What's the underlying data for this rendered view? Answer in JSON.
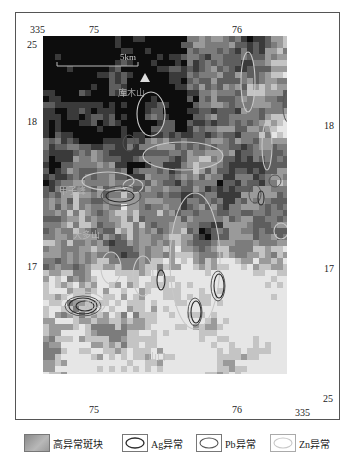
{
  "map": {
    "axis_labels": {
      "top": [
        {
          "text": "335",
          "x": 30,
          "y": 25
        },
        {
          "text": "75",
          "x": 89,
          "y": 25
        },
        {
          "text": "76",
          "x": 232,
          "y": 25
        }
      ],
      "bottom": [
        {
          "text": "75",
          "x": 89,
          "y": 405
        },
        {
          "text": "76",
          "x": 232,
          "y": 405
        },
        {
          "text": "335",
          "x": 295,
          "y": 408
        }
      ],
      "left": [
        {
          "text": "25",
          "x": 27,
          "y": 40
        },
        {
          "text": "18",
          "x": 27,
          "y": 117
        },
        {
          "text": "17",
          "x": 27,
          "y": 262
        }
      ],
      "right": [
        {
          "text": "18",
          "x": 324,
          "y": 121
        },
        {
          "text": "17",
          "x": 324,
          "y": 264
        },
        {
          "text": "25",
          "x": 323,
          "y": 394
        }
      ]
    },
    "scale_bar": {
      "label": "5km",
      "x1": 14,
      "x2": 95,
      "y": 30
    },
    "triangle_marker": {
      "x": 102,
      "y": 42
    },
    "place_names": [
      {
        "text": "库木山",
        "x": 75,
        "y": 50
      },
      {
        "text": "甲子峰",
        "x": 16,
        "y": 148
      },
      {
        "text": "大多山",
        "x": 30,
        "y": 192
      },
      {
        "text": "双山",
        "x": 42,
        "y": 262
      },
      {
        "text": "山口",
        "x": 105,
        "y": 314
      }
    ],
    "colors": {
      "pixel_levels": [
        "#0d0d0d",
        "#3a3a3a",
        "#5e5e5e",
        "#7c7c7c",
        "#9a9a9a",
        "#c4c4c4",
        "#e6e6e6"
      ],
      "ag": "#2a2a2a",
      "pb": "#555555",
      "zn": "#c8c8c8"
    },
    "anomalies": {
      "ag": [
        {
          "cx": 40,
          "cy": 270,
          "rx": 14,
          "ry": 8
        },
        {
          "cx": 42,
          "cy": 270,
          "rx": 9,
          "ry": 5
        },
        {
          "cx": 77,
          "cy": 160,
          "rx": 14,
          "ry": 6
        },
        {
          "cx": 153,
          "cy": 276,
          "rx": 5,
          "ry": 11
        },
        {
          "cx": 176,
          "cy": 250,
          "rx": 5,
          "ry": 12
        },
        {
          "cx": 218,
          "cy": 162,
          "rx": 3,
          "ry": 7
        },
        {
          "cx": 118,
          "cy": 244,
          "rx": 4,
          "ry": 10
        }
      ],
      "pb": [
        {
          "cx": 40,
          "cy": 270,
          "rx": 18,
          "ry": 10
        },
        {
          "cx": 78,
          "cy": 160,
          "rx": 20,
          "ry": 10
        },
        {
          "cx": 152,
          "cy": 276,
          "rx": 7,
          "ry": 14
        },
        {
          "cx": 175,
          "cy": 250,
          "rx": 7,
          "ry": 15
        },
        {
          "cx": 212,
          "cy": 158,
          "rx": 6,
          "ry": 9
        },
        {
          "cx": 232,
          "cy": 145,
          "rx": 6,
          "ry": 6
        },
        {
          "cx": 86,
          "cy": 107,
          "rx": 6,
          "ry": 8
        },
        {
          "cx": 245,
          "cy": 70,
          "rx": 5,
          "ry": 16
        }
      ],
      "zn": [
        {
          "cx": 40,
          "cy": 268,
          "rx": 22,
          "ry": 12
        },
        {
          "cx": 65,
          "cy": 145,
          "rx": 26,
          "ry": 9
        },
        {
          "cx": 90,
          "cy": 150,
          "rx": 10,
          "ry": 7
        },
        {
          "cx": 152,
          "cy": 225,
          "rx": 25,
          "ry": 68
        },
        {
          "cx": 140,
          "cy": 120,
          "rx": 40,
          "ry": 14
        },
        {
          "cx": 108,
          "cy": 78,
          "rx": 14,
          "ry": 22
        },
        {
          "cx": 205,
          "cy": 46,
          "rx": 7,
          "ry": 30
        },
        {
          "cx": 224,
          "cy": 110,
          "rx": 5,
          "ry": 24
        },
        {
          "cx": 238,
          "cy": 195,
          "rx": 7,
          "ry": 8
        },
        {
          "cx": 68,
          "cy": 232,
          "rx": 10,
          "ry": 16
        },
        {
          "cx": 100,
          "cy": 240,
          "rx": 10,
          "ry": 20
        }
      ]
    }
  },
  "legend": {
    "items": [
      {
        "label": "高异常斑块",
        "type": "patch"
      },
      {
        "label": "Ag异常",
        "type": "ag"
      },
      {
        "label": "Pb异常",
        "type": "pb"
      },
      {
        "label": "Zn异常",
        "type": "zn"
      }
    ]
  }
}
